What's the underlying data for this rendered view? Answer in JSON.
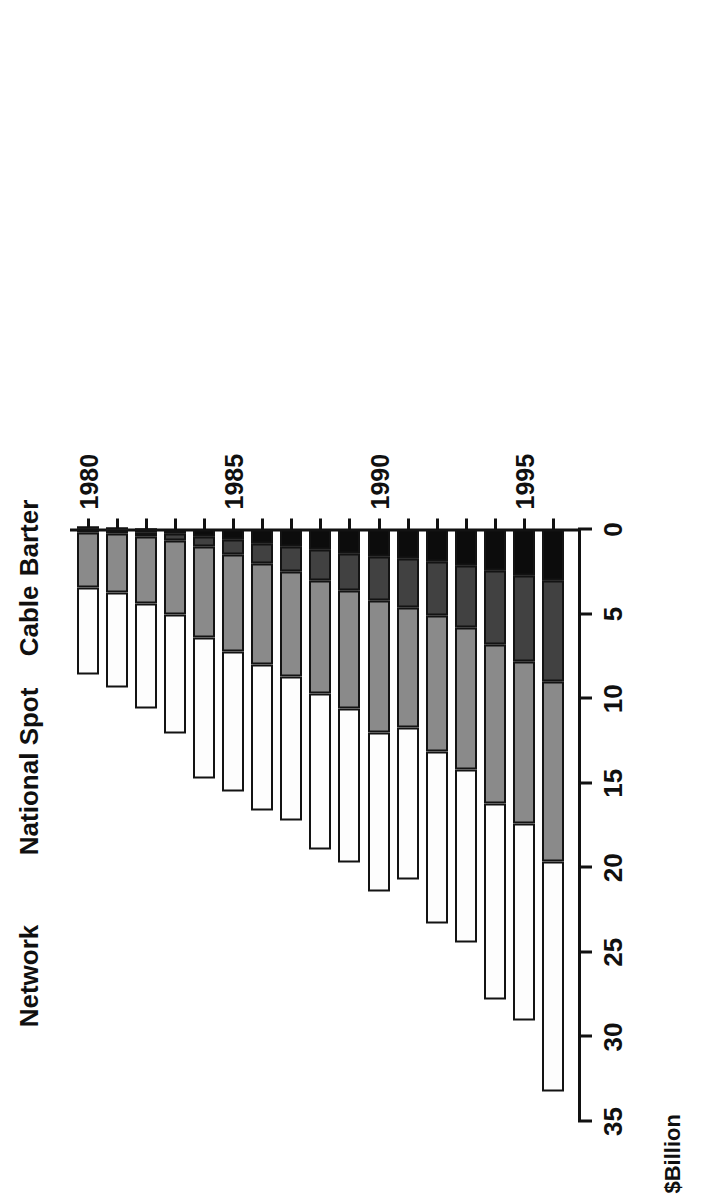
{
  "chart": {
    "type": "bar",
    "title": "",
    "axis_title": "$Billion",
    "series_labels": [
      {
        "key": "network",
        "label": "Network"
      },
      {
        "key": "spot",
        "label": "National Spot"
      },
      {
        "key": "cable",
        "label": "Cable"
      },
      {
        "key": "barter",
        "label": "Barter"
      }
    ],
    "value_ticks": [
      "0",
      "5",
      "10",
      "15",
      "20",
      "25",
      "30",
      "35"
    ],
    "category_ticks": [
      "1980",
      "1985",
      "1990",
      "1995"
    ]
  },
  "chart_data": {
    "type": "bar",
    "orientation": "horizontal-stacked",
    "title": "",
    "xlabel": "$Billion",
    "ylabel": "",
    "xlim": [
      0,
      35
    ],
    "grid": false,
    "legend": "inline-series-labels",
    "colors": {
      "network": "#fdfdfd",
      "spot": "#8a8a8a",
      "cable": "#414141",
      "barter": "#0c0c0c"
    },
    "categories": [
      "1980",
      "1981",
      "1982",
      "1983",
      "1984",
      "1985",
      "1986",
      "1987",
      "1988",
      "1989",
      "1990",
      "1991",
      "1992",
      "1993",
      "1994",
      "1995",
      "1996"
    ],
    "labeled_categories": [
      "1980",
      "1985",
      "1990",
      "1995"
    ],
    "series": [
      {
        "name": "Network",
        "values": [
          5.1,
          5.6,
          6.2,
          7.0,
          8.3,
          8.3,
          8.6,
          8.5,
          9.2,
          9.1,
          9.4,
          9.0,
          10.2,
          10.2,
          11.6,
          11.6,
          13.6
        ]
      },
      {
        "name": "National Spot",
        "values": [
          3.3,
          3.5,
          4.0,
          4.4,
          5.4,
          5.7,
          6.0,
          6.2,
          6.7,
          7.0,
          7.8,
          7.1,
          8.0,
          8.4,
          9.4,
          9.6,
          10.6
        ]
      },
      {
        "name": "Cable",
        "values": [
          0.1,
          0.15,
          0.25,
          0.4,
          0.6,
          0.9,
          1.2,
          1.5,
          1.8,
          2.2,
          2.6,
          2.9,
          3.2,
          3.7,
          4.4,
          5.1,
          6.0
        ]
      },
      {
        "name": "Barter",
        "values": [
          0.05,
          0.1,
          0.15,
          0.25,
          0.4,
          0.6,
          0.8,
          1.0,
          1.2,
          1.4,
          1.6,
          1.7,
          1.9,
          2.1,
          2.4,
          2.7,
          3.0
        ]
      }
    ],
    "totals": [
      8.55,
      9.35,
      10.6,
      12.05,
      14.7,
      15.5,
      16.6,
      17.2,
      18.9,
      19.7,
      21.4,
      20.7,
      23.3,
      24.4,
      27.8,
      29.0,
      33.2
    ]
  }
}
